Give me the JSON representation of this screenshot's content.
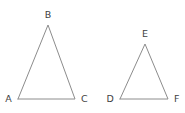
{
  "figure": {
    "background_color": "#ffffff",
    "stroke_color": "#8c8c8c",
    "label_color": "#3f3f3f",
    "stroke_width": 1
  },
  "shapes": [
    {
      "name": "triangle-abc",
      "kind": "triangle",
      "label": "ABC",
      "size": "large",
      "points": "18,99 48,25 75,99 18,99",
      "vertices": [
        {
          "id": "A",
          "label": "A",
          "x": 18,
          "y": 99,
          "label_x": 12,
          "label_y": 102,
          "anchor": "end"
        },
        {
          "id": "B",
          "label": "B",
          "x": 48,
          "y": 25,
          "label_x": 48,
          "label_y": 18,
          "anchor": "middle"
        },
        {
          "id": "C",
          "label": "C",
          "x": 75,
          "y": 99,
          "label_x": 81,
          "label_y": 102,
          "anchor": "start"
        }
      ]
    },
    {
      "name": "triangle-def",
      "kind": "triangle",
      "label": "DEF",
      "size": "small",
      "points": "120,99 145,44 168,99 120,99",
      "vertices": [
        {
          "id": "D",
          "label": "D",
          "x": 120,
          "y": 99,
          "label_x": 114,
          "label_y": 102,
          "anchor": "end"
        },
        {
          "id": "E",
          "label": "E",
          "x": 145,
          "y": 44,
          "label_x": 145,
          "label_y": 37,
          "anchor": "middle"
        },
        {
          "id": "F",
          "label": "F",
          "x": 168,
          "y": 99,
          "label_x": 174,
          "label_y": 102,
          "anchor": "start"
        }
      ]
    }
  ]
}
